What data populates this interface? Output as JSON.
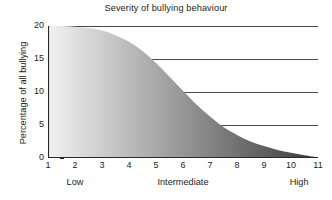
{
  "chart_data": {
    "type": "area",
    "title": "Severity of bullying behaviour",
    "xlabel": "",
    "ylabel": "Percentage of all bullying",
    "xlim": [
      1,
      11
    ],
    "ylim": [
      0,
      20
    ],
    "grid": true,
    "legend": "none",
    "x_ticks": [
      "1",
      "2",
      "3",
      "4",
      "5",
      "6",
      "7",
      "8",
      "9",
      "10",
      "11"
    ],
    "y_ticks": [
      "0",
      "5",
      "10",
      "15",
      "20"
    ],
    "category_labels": [
      {
        "label": "Low",
        "x": 2
      },
      {
        "label": "Intermediate",
        "x": 6
      },
      {
        "label": "High",
        "x": 10.3
      }
    ],
    "x": [
      1,
      1.5,
      2,
      2.5,
      3,
      3.5,
      4,
      4.5,
      5,
      5.5,
      6,
      6.5,
      7,
      7.5,
      8,
      8.5,
      9,
      9.5,
      10,
      10.5,
      11
    ],
    "values": [
      20,
      20,
      19.9,
      19.7,
      19.3,
      18.6,
      17.6,
      16.2,
      14.4,
      12.3,
      10.2,
      8.1,
      6.3,
      4.7,
      3.5,
      2.5,
      1.8,
      1.2,
      0.8,
      0.4,
      0.1
    ],
    "series": [
      {
        "name": "Percentage of all bullying",
        "values": [
          20,
          20,
          19.9,
          19.7,
          19.3,
          18.6,
          17.6,
          16.2,
          14.4,
          12.3,
          10.2,
          8.1,
          6.3,
          4.7,
          3.5,
          2.5,
          1.8,
          1.2,
          0.8,
          0.4,
          0.1
        ]
      }
    ],
    "fill": {
      "type": "horizontal-gradient",
      "from_color": "#f2f2f2",
      "to_color": "#3a3a3a",
      "description": "Light at low severity, dark at high severity"
    },
    "axis_color": "#2a2a2a",
    "grid_color": "#4a4a4a",
    "background": "#ffffff"
  }
}
